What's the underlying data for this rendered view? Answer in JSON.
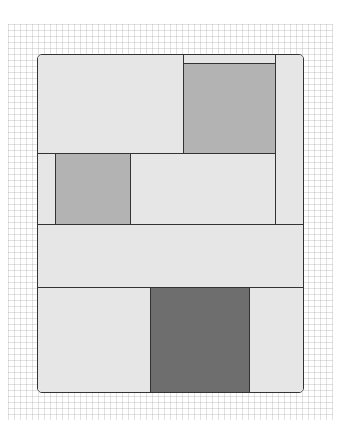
{
  "diagram": {
    "type": "quilt-block-layout",
    "background": "graph-paper",
    "colors": {
      "light": "#e6e6e6",
      "medium": "#b3b3b3",
      "dark": "#6e6e6e",
      "outline": "#333333"
    },
    "pieces": [
      {
        "id": "top-left-rect",
        "shade": "light"
      },
      {
        "id": "top-strip-over-square",
        "shade": "light"
      },
      {
        "id": "top-medium-square",
        "shade": "medium"
      },
      {
        "id": "right-column",
        "shade": "light"
      },
      {
        "id": "row2-left-strip",
        "shade": "light"
      },
      {
        "id": "row2-medium-square",
        "shade": "medium"
      },
      {
        "id": "row2-right-rect",
        "shade": "light"
      },
      {
        "id": "middle-band",
        "shade": "light"
      },
      {
        "id": "bottom-left-rect",
        "shade": "light"
      },
      {
        "id": "bottom-dark-square",
        "shade": "dark"
      },
      {
        "id": "bottom-right-rect",
        "shade": "light"
      }
    ]
  }
}
